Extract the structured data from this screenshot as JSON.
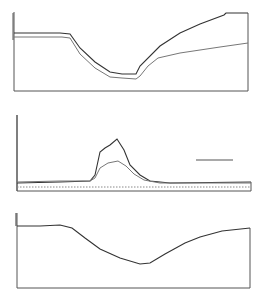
{
  "chart_data": [
    {
      "type": "line",
      "title": "",
      "xlabel": "",
      "ylabel": "",
      "grid": false,
      "legend": null,
      "series": [
        {
          "name": "upper trace",
          "color": "#333333",
          "points": [
            [
              14,
              33
            ],
            [
              60,
              33
            ],
            [
              70,
              34
            ],
            [
              80,
              48
            ],
            [
              95,
              62
            ],
            [
              110,
              72
            ],
            [
              122,
              74
            ],
            [
              136,
              74
            ],
            [
              140,
              66
            ],
            [
              160,
              46
            ],
            [
              180,
              33
            ],
            [
              200,
              24
            ],
            [
              224,
              15
            ],
            [
              226,
              13
            ],
            [
              248,
              13
            ]
          ]
        },
        {
          "name": "lower trace",
          "color": "#777777",
          "points": [
            [
              14,
              37
            ],
            [
              62,
              37
            ],
            [
              70,
              38
            ],
            [
              80,
              54
            ],
            [
              95,
              68
            ],
            [
              110,
              77
            ],
            [
              122,
              78
            ],
            [
              136,
              79
            ],
            [
              140,
              76
            ],
            [
              148,
              66
            ],
            [
              158,
              58
            ],
            [
              180,
              53
            ],
            [
              200,
              50
            ],
            [
              220,
              47
            ],
            [
              248,
              43
            ]
          ]
        }
      ]
    },
    {
      "type": "line",
      "title": "",
      "xlabel": "",
      "ylabel": "",
      "grid": false,
      "legend": null,
      "annotations": [
        "scale bar"
      ],
      "series": [
        {
          "name": "upper trace",
          "color": "#333333",
          "points": [
            [
              17,
              183
            ],
            [
              60,
              182
            ],
            [
              90,
              181
            ],
            [
              95,
              175
            ],
            [
              100,
              152
            ],
            [
              105,
              148
            ],
            [
              110,
              145
            ],
            [
              117,
              139
            ],
            [
              124,
              150
            ],
            [
              130,
              165
            ],
            [
              140,
              175
            ],
            [
              150,
              181
            ],
            [
              170,
              183
            ],
            [
              251,
              182
            ]
          ]
        },
        {
          "name": "lower trace",
          "color": "#777777",
          "points": [
            [
              17,
              182
            ],
            [
              60,
              181
            ],
            [
              90,
              181
            ],
            [
              95,
              178
            ],
            [
              100,
              168
            ],
            [
              108,
              163
            ],
            [
              118,
              161
            ],
            [
              126,
              166
            ],
            [
              134,
              174
            ],
            [
              144,
              180
            ],
            [
              160,
              183
            ],
            [
              251,
              183
            ]
          ]
        },
        {
          "name": "baseline (dotted)",
          "color": "#888888",
          "points": [
            [
              17,
              187
            ],
            [
              251,
              187
            ]
          ]
        }
      ]
    },
    {
      "type": "line",
      "title": "",
      "xlabel": "",
      "ylabel": "",
      "grid": false,
      "legend": null,
      "series": [
        {
          "name": "trace",
          "color": "#333333",
          "points": [
            [
              17,
              226
            ],
            [
              40,
              226
            ],
            [
              60,
              225
            ],
            [
              72,
              228
            ],
            [
              85,
              238
            ],
            [
              100,
              249
            ],
            [
              120,
              258
            ],
            [
              140,
              264
            ],
            [
              150,
              263
            ],
            [
              165,
              254
            ],
            [
              185,
              243
            ],
            [
              200,
              237
            ],
            [
              222,
              231
            ],
            [
              250,
              228
            ]
          ]
        }
      ]
    }
  ]
}
